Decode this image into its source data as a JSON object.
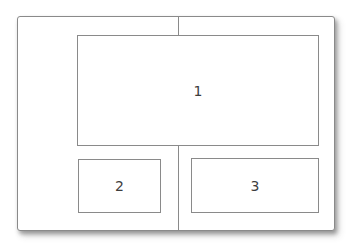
{
  "figure": {
    "kind": "nested-box-layout-diagram",
    "outer_frame": {
      "label": ""
    },
    "boxes": [
      {
        "label": "1"
      },
      {
        "label": "2"
      },
      {
        "label": "3"
      }
    ],
    "connectors": [
      {
        "name": "top-center-vertical-line"
      },
      {
        "name": "bottom-center-vertical-line"
      }
    ],
    "colors": {
      "border": "#8a8a8a",
      "label_text": "#3d3d3d",
      "background": "#ffffff"
    }
  }
}
